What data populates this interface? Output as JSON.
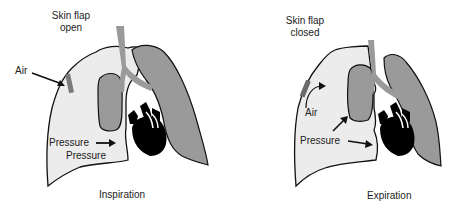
{
  "panels": [
    {
      "id": "inspiration",
      "caption": "Inspiration",
      "flap_label_line1": "Skin flap",
      "flap_label_line2": "open",
      "air_label": "Air",
      "pressure_label_1": "Pressure",
      "pressure_label_2": "Pressure"
    },
    {
      "id": "expiration",
      "caption": "Expiration",
      "flap_label_line1": "Skin flap",
      "flap_label_line2": "closed",
      "air_label": "Air",
      "pressure_label_1": "Pressure"
    }
  ],
  "colors": {
    "affected_lung": "#ececec",
    "collapsed_lung": "#9a9a9a",
    "outline": "#111111",
    "heart": "#000000",
    "trachea": "#9a9a9a"
  }
}
